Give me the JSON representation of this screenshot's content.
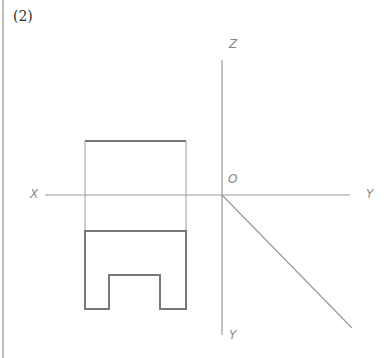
{
  "problem_number": "(2)",
  "axes": {
    "z_label": "Z",
    "origin_label": "O",
    "x_label": "X",
    "y_right_label": "Y",
    "y_bottom_label": "Y"
  },
  "colors": {
    "axis": "#9a9a9a",
    "outline": "#777777",
    "border": "#aaaaaa"
  }
}
